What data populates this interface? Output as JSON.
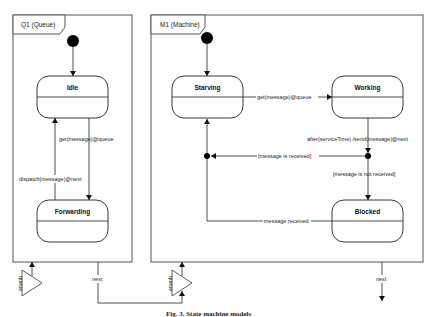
{
  "diagram": {
    "queue": {
      "title": "Q1 (Queue)",
      "states": {
        "idle": "Idle",
        "forwarding": "Forwarding"
      },
      "transitions": {
        "idle_to_forwarding": "get(message)@queue",
        "forwarding_to_idle": "dispatch(message)@next"
      },
      "ports": {
        "in": "queue",
        "out": "next"
      }
    },
    "machine": {
      "title": "M1 (Machine)",
      "states": {
        "starving": "Starving",
        "working": "Working",
        "blocked": "Blocked"
      },
      "transitions": {
        "starving_to_working": "get(message)@queue",
        "working_exit": "after(serviceTime) /send(message)@next",
        "received": "[message is received]",
        "not_received": "[message is not received]",
        "blocked_to_starving": "message received"
      },
      "ports": {
        "in": "queue",
        "out": "next"
      }
    },
    "caption": "Fig. 3. State machine models"
  }
}
